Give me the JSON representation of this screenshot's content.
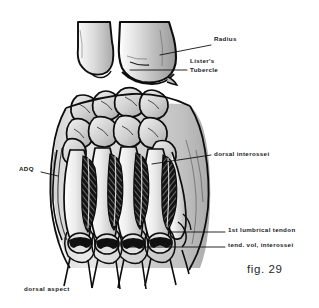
{
  "figure": {
    "number": "fig. 29",
    "view_label": "dorsal aspect",
    "style": "ink line drawing with grey wash",
    "background_color": "#ffffff",
    "ink_color": "#111111",
    "wash_light": "#d8d8d8",
    "wash_mid": "#b4b4b4",
    "wash_dark": "#8a8a8a",
    "muscle_color": "#1a1a1a"
  },
  "labels": [
    {
      "id": "radius",
      "text": "Radius",
      "text_x": 214,
      "text_y": 40,
      "leader": {
        "x1": 211,
        "y1": 45,
        "x2": 160,
        "y2": 55
      }
    },
    {
      "id": "listers-tubercle",
      "line1": "Lister's",
      "line2": "Tubercle",
      "text_x": 190,
      "text_y": 62,
      "leader": {
        "x1": 187,
        "y1": 70,
        "x2": 130,
        "y2": 70
      }
    },
    {
      "id": "dorsal-interossei",
      "text": "dorsal interossei",
      "text_x": 214,
      "text_y": 152,
      "leader": {
        "x1": 211,
        "y1": 155,
        "x2": 152,
        "y2": 164
      }
    },
    {
      "id": "adq",
      "text": "ADQ",
      "text_x": 19,
      "text_y": 168,
      "leader": {
        "x1": 41,
        "y1": 172,
        "x2": 58,
        "y2": 176
      }
    },
    {
      "id": "first-lumbrical-tendon",
      "text": "1st lumbrical tendon",
      "text_x": 228,
      "text_y": 228,
      "leader": {
        "x1": 225,
        "y1": 232,
        "x2": 168,
        "y2": 232
      }
    },
    {
      "id": "tendon-volar-interossei",
      "text": "tend. vol, interossei",
      "text_x": 228,
      "text_y": 243,
      "leader": {
        "x1": 225,
        "y1": 247,
        "x2": 124,
        "y2": 247
      }
    }
  ],
  "anatomy": {
    "bones": [
      {
        "name": "ulna-distal",
        "side": "left",
        "description": "distal ulna with styloid process"
      },
      {
        "name": "radius-distal",
        "side": "right",
        "description": "distal radius, broad metaphysis"
      },
      {
        "name": "listers-tubercle",
        "description": "dorsal tubercle on radius"
      },
      {
        "name": "carpal-bones",
        "count": 8,
        "description": "proximal and distal carpal rows"
      },
      {
        "name": "metacarpals",
        "count": 5,
        "description": "metacarpal shafts seen dorsally"
      },
      {
        "name": "proximal-phalanges",
        "count": 5
      }
    ],
    "muscles": [
      {
        "name": "dorsal-interosseous-1",
        "pattern": "pennate"
      },
      {
        "name": "dorsal-interosseous-2",
        "pattern": "pennate"
      },
      {
        "name": "dorsal-interosseous-3",
        "pattern": "pennate"
      },
      {
        "name": "dorsal-interosseous-4",
        "pattern": "pennate"
      },
      {
        "name": "abductor-digiti-quinti",
        "abbrev": "ADQ"
      }
    ],
    "tendons": [
      {
        "name": "first-lumbrical-tendon"
      },
      {
        "name": "volar-interossei-tendons"
      },
      {
        "name": "extensor-hood-bands",
        "count": 4
      }
    ]
  }
}
